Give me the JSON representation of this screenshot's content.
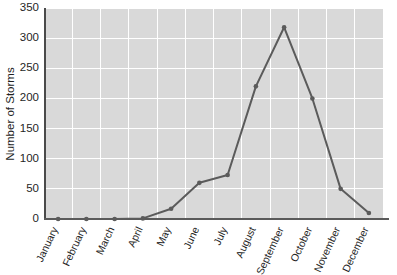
{
  "chart_data": {
    "type": "line",
    "title": "",
    "xlabel": "",
    "ylabel": "Number of Storms",
    "categories": [
      "January",
      "February",
      "March",
      "April",
      "May",
      "June",
      "July",
      "August",
      "September",
      "October",
      "November",
      "December"
    ],
    "values": [
      0,
      0,
      0,
      1,
      17,
      60,
      73,
      220,
      318,
      200,
      50,
      10
    ],
    "series": [
      {
        "name": "Number of Storms",
        "values": [
          0,
          0,
          0,
          1,
          17,
          60,
          73,
          220,
          318,
          200,
          50,
          10
        ]
      }
    ],
    "ylim": [
      0,
      350
    ],
    "yticks": [
      0,
      50,
      100,
      150,
      200,
      250,
      300,
      350
    ],
    "ytick_labels": [
      "0",
      "50",
      "100",
      "150",
      "200",
      "250",
      "300",
      "350"
    ],
    "grid": true,
    "grid_color": "#ffffff",
    "legend": "none",
    "plot_background": "#d9d9d9",
    "line_color": "#5b5b5b",
    "marker_color": "#5b5b5b",
    "axis_color": "#4a4a4a",
    "xtick_rotation": 65
  }
}
